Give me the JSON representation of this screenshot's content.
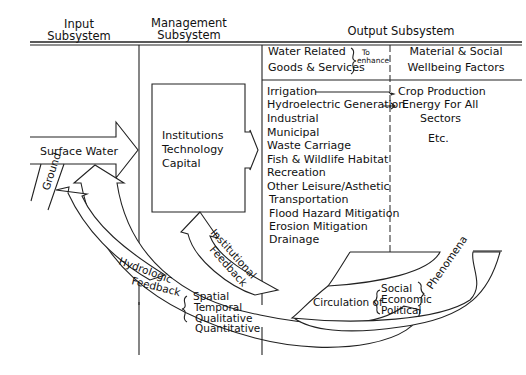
{
  "diagram": {
    "headers": {
      "input": [
        "Input",
        "Subsystem"
      ],
      "management": [
        "Management",
        "Subsystem"
      ],
      "output": "Output Subsystem"
    },
    "output_columns": {
      "left_header": [
        "Water Related",
        "Goods & Services"
      ],
      "connector": [
        "To",
        "enhance"
      ],
      "right_header": [
        "Material & Social",
        "Wellbeing Factors"
      ]
    },
    "water_uses": [
      "Irrigation",
      "Hydroelectric Generation",
      "Industrial",
      "Municipal",
      "Waste Carriage",
      "Fish & Wildlife Habitat",
      "Recreation",
      "Other Leisure/Asthetic",
      "Transportation",
      "Flood Hazard Mitigation",
      "Erosion Mitigation",
      "Drainage"
    ],
    "wellbeing_factors": [
      "Crop Production",
      "Energy For All",
      "Sectors",
      "Etc."
    ],
    "management_box": [
      "Institutions",
      "Technology",
      "Capital"
    ],
    "inputs": {
      "surface_water": "Surface Water",
      "ground": "Ground"
    },
    "feedback": {
      "institutional": [
        "Institutional",
        "Feedback"
      ],
      "hydrologic": [
        "Hydrologic",
        "Feedback"
      ],
      "hydrologic_dimensions": [
        "Spatial",
        "Temporal",
        "Qualitative",
        "Quantitative"
      ]
    },
    "circulation": {
      "prefix": "Circulation of",
      "items": [
        "Social",
        "Economic",
        "Political"
      ],
      "suffix": "Phenomena"
    }
  }
}
